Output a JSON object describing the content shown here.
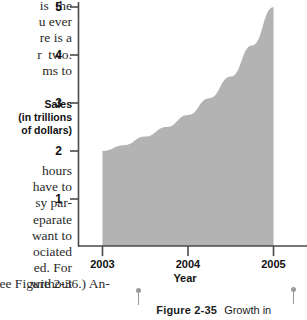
{
  "document": {
    "body_text_top": "is  the\nu ever\nre is a\nr  two.\nms to",
    "body_text_middle": "hours\nhave to\nsy par-\neparate\nwant to\nociated\ned. For\nwithout",
    "body_text_bottom": "See Figure 2-36.) An-"
  },
  "figure": {
    "caption_number": "Figure 2-35",
    "caption_text": "Growth in",
    "y_axis_title_lines": [
      "Sales",
      "(in trillions",
      "of dollars)"
    ],
    "x_axis_title": "Year"
  },
  "chart_data": {
    "type": "area",
    "title": "",
    "xlabel": "Year",
    "ylabel": "Sales (in trillions of dollars)",
    "x": [
      2003,
      2004,
      2005
    ],
    "xtick_labels": [
      "2003",
      "2004",
      "2005"
    ],
    "ytick_labels": [
      "1",
      "2",
      "3",
      "4",
      "5"
    ],
    "yticks": [
      1,
      2,
      3,
      4,
      5
    ],
    "ylim": [
      0,
      5
    ],
    "xlim": [
      2003,
      2005
    ],
    "values": [
      2.0,
      2.7,
      5.0
    ],
    "curve_points": [
      {
        "x": 2003.0,
        "y": 2.0
      },
      {
        "x": 2003.25,
        "y": 2.12
      },
      {
        "x": 2003.5,
        "y": 2.3
      },
      {
        "x": 2003.75,
        "y": 2.5
      },
      {
        "x": 2004.0,
        "y": 2.75
      },
      {
        "x": 2004.25,
        "y": 3.1
      },
      {
        "x": 2004.5,
        "y": 3.55
      },
      {
        "x": 2004.75,
        "y": 4.2
      },
      {
        "x": 2005.0,
        "y": 5.0
      }
    ],
    "grid": false,
    "legend": "none",
    "fill_color": "#b3b3b3",
    "axis_color": "#4a4a4a",
    "series": [
      {
        "name": "Sales",
        "values": [
          2.0,
          2.75,
          5.0
        ]
      }
    ]
  },
  "colors": {
    "area_fill": "#b3b3b3",
    "axis": "#4a4a4a",
    "text": "#111111",
    "pin": "#9a9a9a",
    "background": "#ffffff"
  }
}
